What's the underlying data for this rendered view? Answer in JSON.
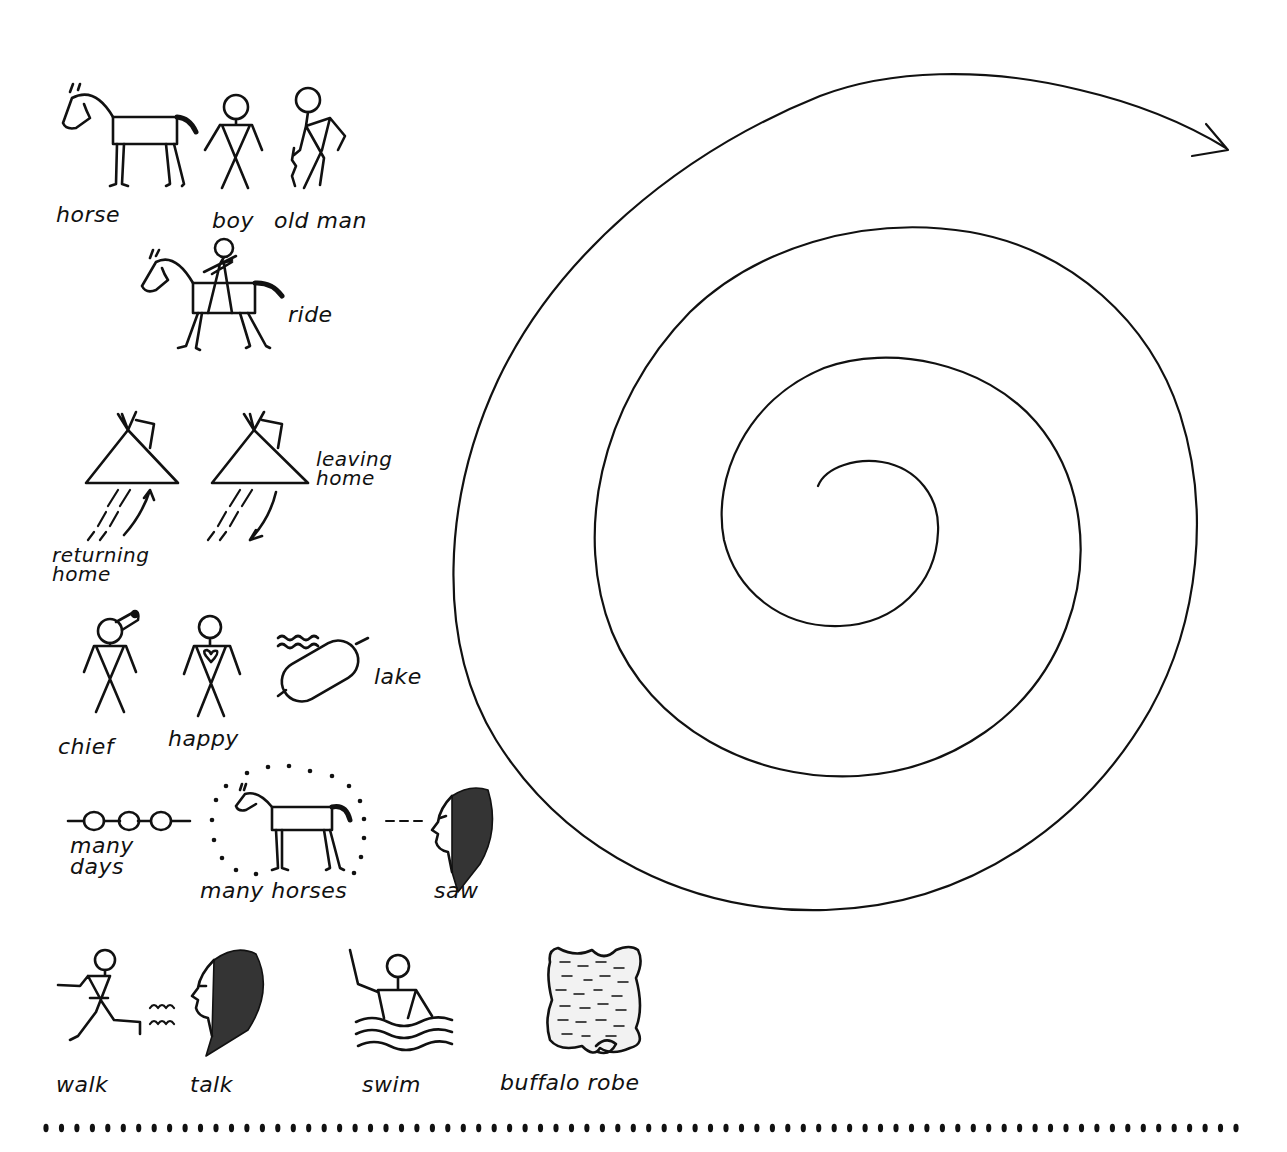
{
  "figure": {
    "background": "#ffffff",
    "ink_color": "#111111"
  },
  "symbols": [
    {
      "id": "horse",
      "label": "horse"
    },
    {
      "id": "boy",
      "label": "boy"
    },
    {
      "id": "old-man",
      "label": "old man"
    },
    {
      "id": "ride",
      "label": "ride"
    },
    {
      "id": "returning-home",
      "label": "returning\nhome"
    },
    {
      "id": "leaving-home",
      "label": "leaving\nhome"
    },
    {
      "id": "chief",
      "label": "chief"
    },
    {
      "id": "happy",
      "label": "happy"
    },
    {
      "id": "lake",
      "label": "lake"
    },
    {
      "id": "many-days",
      "label": "many\ndays"
    },
    {
      "id": "many-horses",
      "label": "many horses"
    },
    {
      "id": "saw",
      "label": "saw"
    },
    {
      "id": "walk",
      "label": "walk"
    },
    {
      "id": "talk",
      "label": "talk"
    },
    {
      "id": "swim",
      "label": "swim"
    },
    {
      "id": "buffalo-robe",
      "label": "buffalo robe"
    }
  ],
  "spiral": {
    "turns": 3,
    "direction": "outward-clockwise",
    "ends_with": "arrow pointing right"
  },
  "divider": {
    "style": "dotted",
    "dot_count": 78
  }
}
